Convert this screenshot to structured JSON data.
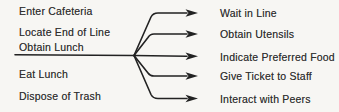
{
  "diagram": {
    "left_items": [
      "Enter Cafeteria",
      "Locate End of Line",
      "Obtain Lunch",
      "Eat Lunch",
      "Dispose of Trash"
    ],
    "right_items": [
      "Wait in Line",
      "Obtain Utensils",
      "Indicate Preferred Food",
      "Give Ticket to Staff",
      "Interact with Peers"
    ],
    "branch_from": "Obtain Lunch",
    "colors": {
      "line": "#222222",
      "text": "#303030",
      "background": "#f7f6f3"
    }
  }
}
